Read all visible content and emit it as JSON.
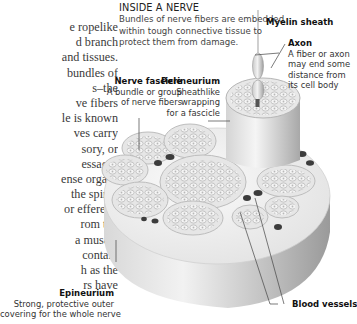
{
  "body_text": {
    "lines": [
      "e ropelike",
      "d branch",
      " and tissues.",
      " bundles of",
      "s–the",
      "ve fibers",
      "le is known",
      "ves carry",
      "sory, or",
      "essages",
      "ense organs",
      " the spinal",
      " or efferent,",
      "rom the",
      " a muscle",
      " contain",
      "h as the",
      "rs have"
    ]
  },
  "inset": {
    "heading": "INSIDE A NERVE",
    "intro_lines": [
      "Bundles of nerve fibers are embedded",
      "within tough connective tissue to",
      "protect them from damage."
    ]
  },
  "labels": {
    "myelin": {
      "title": "Myelin sheath"
    },
    "axon": {
      "title": "Axon",
      "lines": [
        "A fiber or axon",
        "may end some",
        "distance from",
        "its cell body"
      ]
    },
    "fascicle": {
      "title": "Nerve fascicle",
      "lines": [
        "A bundle or group",
        "of nerve fibers"
      ]
    },
    "perineurium": {
      "title": "Perineurium",
      "lines": [
        "Sheathlike",
        "wrapping",
        "for a fascicle"
      ]
    },
    "epineurium": {
      "title": "Epineurium",
      "lines": [
        "Strong, protective outer",
        "covering for the whole nerve"
      ]
    },
    "blood_vessels": {
      "title": "Blood vessels"
    }
  },
  "colors": {
    "nerve_top": "#f0f0f0",
    "nerve_side": "#cfcfcf",
    "fascicle_fill": "#e4e4e4",
    "vessel": "#3c3c3c",
    "leader": "#444444"
  }
}
